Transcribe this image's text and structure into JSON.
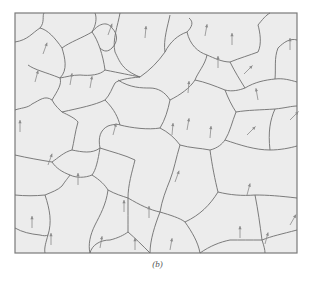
{
  "figure": {
    "caption": "(b)",
    "frame": {
      "x": 15,
      "y": 13,
      "width": 282,
      "height": 240
    },
    "colors": {
      "background": "#ececec",
      "boundary": "#6e6e6e",
      "frame": "#7a7a7a",
      "arrow": "#8a8a8a"
    },
    "boundaries": [
      "M15,42 C28,40 32,33 40,28 C45,22 42,16 44,13",
      "M40,28 C48,30 55,38 62,48 C65,58 68,70 60,78",
      "M62,48 C70,42 82,38 92,32 C96,25 97,18 95,13",
      "M92,32 C98,40 103,55 105,70 C100,75 90,76 80,75 C72,75 66,77 60,78",
      "M60,78 C45,72 35,70 28,65",
      "M105,70 C120,73 130,75 140,77",
      "M92,32 C100,22 108,22 112,28 C118,34 118,42 112,48 C108,52 104,52 100,48",
      "M120,13 C118,25 112,40 115,52 C120,62 122,70 140,77",
      "M140,77 C150,70 158,62 165,52 C170,42 178,35 187,32",
      "M170,15 C168,25 163,40 165,52",
      "M187,32 C192,27 194,22 189,18",
      "M15,110 C20,108 28,108 32,104 C40,100 45,95 52,100 C55,106 60,110 62,112",
      "M52,100 C58,90 62,84 60,78",
      "M62,112 C80,108 95,105 105,100 C110,95 112,88 115,83 C118,80 128,78 140,77",
      "M105,100 C115,110 118,118 120,125",
      "M62,112 C68,115 75,118 78,122 C75,132 74,142 72,150",
      "M15,155 C28,158 40,160 52,162 C58,158 64,152 72,150",
      "M72,150 C82,152 92,154 100,148 C98,138 100,130 108,126 C114,124 118,124 120,125",
      "M100,148 C98,160 96,170 92,175 C85,178 76,178 70,175 C62,172 56,168 52,162",
      "M120,125 C132,128 148,130 160,128 C165,120 168,110 170,100",
      "M170,100 C165,92 158,88 150,88 C142,88 130,88 118,80",
      "M187,32 C190,45 198,52 207,55 C214,58 222,62 230,62",
      "M230,62 C240,58 250,55 258,52 C262,44 260,32 258,25",
      "M230,62 C235,72 240,80 245,88",
      "M245,88 C255,82 265,80 275,79 C283,78 290,80 297,82",
      "M258,25 C262,20 266,15 270,13",
      "M275,79 C276,68 274,58 278,48 C284,42 290,38 297,40",
      "M207,55 C205,65 198,72 195,80 C190,88 180,95 170,100",
      "M195,80 C205,82 215,86 225,90 C232,92 240,90 245,88",
      "M225,90 C228,98 232,106 236,112",
      "M236,112 C248,110 260,110 275,109 C285,108 292,106 297,106",
      "M236,112 C232,122 230,132 225,140",
      "M160,128 C168,132 175,138 180,145",
      "M180,145 C190,148 200,148 210,150 C218,148 222,144 225,140",
      "M15,195 C25,196 35,196 45,195 C52,192 58,190 62,186 C66,180 68,178 70,175",
      "M100,148 C112,152 125,155 135,160",
      "M135,160 C132,172 128,185 128,198",
      "M92,175 C100,180 105,185 108,190 C115,194 122,196 128,198",
      "M45,195 C50,210 52,222 48,235 C46,242 44,248 45,253",
      "M108,190 C106,205 100,215 95,225 C90,235 88,245 90,253",
      "M128,198 C140,205 150,210 160,212 C170,215 180,218 185,222",
      "M180,145 C176,158 174,170 170,180 C166,190 162,200 160,212",
      "M210,150 C212,165 215,180 218,192",
      "M218,192 C230,195 242,196 255,195 C268,195 280,196 297,198",
      "M225,140 C240,145 255,150 270,150 C280,150 290,148 297,146",
      "M185,222 C192,232 198,242 200,253",
      "M218,192 C210,205 200,215 185,222",
      "M255,195 C258,210 260,225 262,240 C264,246 265,250 265,253",
      "M15,228 C22,232 30,234 40,235 C44,236 46,236 48,235",
      "M90,253 C92,245 100,240 110,240 C118,238 124,235 128,232 C128,222 128,210 128,198",
      "M160,212 C155,225 150,240 150,253",
      "M262,240 C272,236 282,234 297,230",
      "M275,109 C270,120 268,132 270,150",
      "M128,232 C135,238 142,245 150,253",
      "M200,253 C210,246 220,242 230,240 C240,240 250,240 262,240"
    ],
    "arrows": [
      {
        "x": 43,
        "y": 54,
        "len": 12,
        "angle": -70
      },
      {
        "x": 35,
        "y": 82,
        "len": 12,
        "angle": -75
      },
      {
        "x": 70,
        "y": 85,
        "len": 12,
        "angle": -80
      },
      {
        "x": 90,
        "y": 88,
        "len": 12,
        "angle": -80
      },
      {
        "x": 108,
        "y": 35,
        "len": 12,
        "angle": -70
      },
      {
        "x": 145,
        "y": 38,
        "len": 12,
        "angle": -85
      },
      {
        "x": 205,
        "y": 36,
        "len": 12,
        "angle": -80
      },
      {
        "x": 232,
        "y": 45,
        "len": 12,
        "angle": -90
      },
      {
        "x": 290,
        "y": 50,
        "len": 12,
        "angle": -90
      },
      {
        "x": 218,
        "y": 68,
        "len": 12,
        "angle": -90
      },
      {
        "x": 244,
        "y": 74,
        "len": 12,
        "angle": -45
      },
      {
        "x": 188,
        "y": 93,
        "len": 12,
        "angle": -85
      },
      {
        "x": 258,
        "y": 100,
        "len": 12,
        "angle": -100
      },
      {
        "x": 20,
        "y": 132,
        "len": 12,
        "angle": -90
      },
      {
        "x": 113,
        "y": 135,
        "len": 12,
        "angle": -75
      },
      {
        "x": 172,
        "y": 135,
        "len": 12,
        "angle": -85
      },
      {
        "x": 210,
        "y": 138,
        "len": 12,
        "angle": -85
      },
      {
        "x": 290,
        "y": 120,
        "len": 12,
        "angle": -45
      },
      {
        "x": 247,
        "y": 135,
        "len": 12,
        "angle": -45
      },
      {
        "x": 48,
        "y": 165,
        "len": 12,
        "angle": -70
      },
      {
        "x": 78,
        "y": 185,
        "len": 12,
        "angle": -90
      },
      {
        "x": 175,
        "y": 182,
        "len": 12,
        "angle": -70
      },
      {
        "x": 187,
        "y": 130,
        "len": 12,
        "angle": -80
      },
      {
        "x": 124,
        "y": 212,
        "len": 12,
        "angle": -90
      },
      {
        "x": 149,
        "y": 218,
        "len": 12,
        "angle": -90
      },
      {
        "x": 247,
        "y": 195,
        "len": 12,
        "angle": -75
      },
      {
        "x": 32,
        "y": 228,
        "len": 12,
        "angle": -90
      },
      {
        "x": 51,
        "y": 245,
        "len": 12,
        "angle": -90
      },
      {
        "x": 100,
        "y": 248,
        "len": 12,
        "angle": -80
      },
      {
        "x": 135,
        "y": 250,
        "len": 12,
        "angle": -90
      },
      {
        "x": 240,
        "y": 238,
        "len": 12,
        "angle": -90
      },
      {
        "x": 265,
        "y": 244,
        "len": 12,
        "angle": -75
      },
      {
        "x": 290,
        "y": 225,
        "len": 12,
        "angle": -60
      },
      {
        "x": 170,
        "y": 250,
        "len": 12,
        "angle": -80
      }
    ]
  }
}
